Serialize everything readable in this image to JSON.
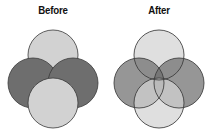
{
  "figure": {
    "title": "",
    "background_color": "#ffffff",
    "width": 212,
    "height": 136
  },
  "palette": {
    "light_gray": "#d2d2d2",
    "dark_gray": "#6e6e6e",
    "outline": "#3a3a3a",
    "label_color": "#111111",
    "background": "#ffffff"
  },
  "panels": [
    {
      "key": "before",
      "label": "Before",
      "style": "opaque-stacked",
      "description": "Four opaque overlapping circles; later circles hide earlier ones with no blending.",
      "circles": [
        {
          "name": "top-circle",
          "fill": "#d2d2d2",
          "cx": 53,
          "cy": 35,
          "r": 25,
          "opacity": 1.0
        },
        {
          "name": "left-circle",
          "fill": "#6e6e6e",
          "cx": 33,
          "cy": 63,
          "r": 25,
          "opacity": 1.0
        },
        {
          "name": "right-circle",
          "fill": "#6e6e6e",
          "cx": 73,
          "cy": 63,
          "r": 25,
          "opacity": 1.0
        },
        {
          "name": "bottom-circle",
          "fill": "#d2d2d2",
          "cx": 53,
          "cy": 83,
          "r": 25,
          "opacity": 1.0
        }
      ]
    },
    {
      "key": "after",
      "label": "After",
      "style": "transparent-blended",
      "description": "Same four circles rendered semi-transparent so every intersection region and arc outline is visible.",
      "circles": [
        {
          "name": "top-circle",
          "fill": "#d2d2d2",
          "cx": 53,
          "cy": 35,
          "r": 25,
          "opacity": 0.72
        },
        {
          "name": "left-circle",
          "fill": "#6e6e6e",
          "cx": 33,
          "cy": 63,
          "r": 25,
          "opacity": 0.72
        },
        {
          "name": "right-circle",
          "fill": "#6e6e6e",
          "cx": 73,
          "cy": 63,
          "r": 25,
          "opacity": 0.72
        },
        {
          "name": "bottom-circle",
          "fill": "#d2d2d2",
          "cx": 53,
          "cy": 83,
          "r": 25,
          "opacity": 0.72
        }
      ]
    }
  ]
}
